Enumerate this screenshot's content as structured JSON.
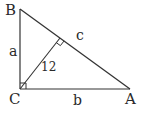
{
  "diagram": {
    "type": "right-triangle-with-altitude",
    "stroke_color": "#333333",
    "text_color": "#2a2a2a",
    "background": "#ffffff",
    "vertices": {
      "B": {
        "label": "B",
        "x": 20,
        "y": 9
      },
      "C": {
        "label": "C",
        "x": 20,
        "y": 89
      },
      "A": {
        "label": "A",
        "x": 130,
        "y": 89
      },
      "H": {
        "x": 60,
        "y": 40
      }
    },
    "sides": {
      "a": {
        "label": "a",
        "from": "B",
        "to": "C"
      },
      "b": {
        "label": "b",
        "from": "C",
        "to": "A"
      },
      "c": {
        "label": "c",
        "from": "B",
        "to": "A"
      }
    },
    "altitude": {
      "label": "12",
      "from": "C",
      "to": "H"
    },
    "right_angles": [
      "C",
      "H"
    ]
  }
}
